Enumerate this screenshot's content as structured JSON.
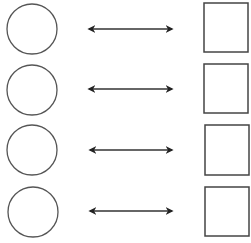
{
  "diagram": {
    "stroke_color": "#333333",
    "rows": [
      {
        "circle": {
          "cx": 32,
          "cy": 29,
          "r": 25
        },
        "arrow": {
          "x1": 86,
          "x2": 175,
          "y": 29
        },
        "square": {
          "x": 204,
          "y": 3,
          "w": 44,
          "h": 49
        }
      },
      {
        "circle": {
          "cx": 32,
          "cy": 90,
          "r": 25
        },
        "arrow": {
          "x1": 86,
          "x2": 175,
          "y": 89
        },
        "square": {
          "x": 204,
          "y": 64,
          "w": 44,
          "h": 49
        }
      },
      {
        "circle": {
          "cx": 32,
          "cy": 150,
          "r": 25
        },
        "arrow": {
          "x1": 87,
          "x2": 175,
          "y": 150
        },
        "square": {
          "x": 205,
          "y": 125,
          "w": 44,
          "h": 50
        }
      },
      {
        "circle": {
          "cx": 33,
          "cy": 212,
          "r": 25
        },
        "arrow": {
          "x1": 87,
          "x2": 175,
          "y": 211
        },
        "square": {
          "x": 205,
          "y": 187,
          "w": 44,
          "h": 49
        }
      }
    ]
  },
  "caption": {
    "text": ""
  }
}
